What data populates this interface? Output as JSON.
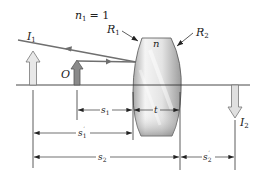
{
  "diagram": {
    "medium_label": "n",
    "medium_sub": "1",
    "medium_value": "= 1",
    "lens_index_label": "n",
    "surfaces": [
      {
        "label": "R",
        "sub": "1"
      },
      {
        "label": "R",
        "sub": "2"
      }
    ],
    "objects": [
      {
        "label": "I",
        "sub": "1",
        "kind": "intermediate image",
        "direction": "up"
      },
      {
        "label": "O",
        "sub": "",
        "kind": "object",
        "direction": "up"
      },
      {
        "label": "I",
        "sub": "2",
        "kind": "final image",
        "direction": "down"
      }
    ],
    "dimensions": [
      {
        "label": "s",
        "sub": "1",
        "prime": false
      },
      {
        "label": "t",
        "sub": "",
        "prime": false
      },
      {
        "label": "s",
        "sub": "1",
        "prime": true
      },
      {
        "label": "s",
        "sub": "2",
        "prime": false
      },
      {
        "label": "s",
        "sub": "2",
        "prime": true
      }
    ],
    "colors": {
      "lens_light": "#f2f2f2",
      "lens_dark": "#9a9a9a",
      "arrow_light": "#e6e6e6",
      "arrow_dark": "#8a8a8a",
      "line": "#333333",
      "ray": "#777777"
    }
  }
}
